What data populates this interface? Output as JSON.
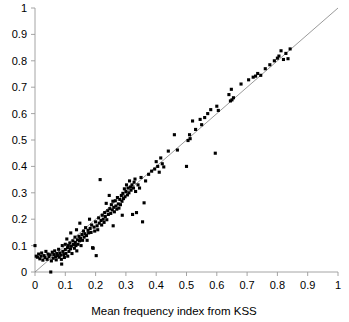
{
  "chart_data": {
    "type": "scatter",
    "title": "",
    "xlabel": "Mean frequency index from KSS",
    "ylabel": "",
    "xlim": [
      0,
      1
    ],
    "ylim": [
      0,
      1
    ],
    "grid": false,
    "legend": null,
    "xticks": [
      "0",
      "0.1",
      "0.2",
      "0.3",
      "0.4",
      "0.5",
      "0.6",
      "0.7",
      "0.8",
      "0.9",
      "1"
    ],
    "yticks": [
      "0",
      "0.1",
      "0.2",
      "0.3",
      "0.4",
      "0.5",
      "0.6",
      "0.7",
      "0.8",
      "0.9",
      "1"
    ],
    "xtick_values": [
      0,
      0.1,
      0.2,
      0.3,
      0.4,
      0.5,
      0.6,
      0.7,
      0.8,
      0.9,
      1
    ],
    "ytick_values": [
      0,
      0.1,
      0.2,
      0.3,
      0.4,
      0.5,
      0.6,
      0.7,
      0.8,
      0.9,
      1
    ],
    "marker": {
      "shape": "square",
      "size": 3.1,
      "color": "#000000"
    },
    "reference_line": {
      "name": "identity-line",
      "from": [
        0,
        0
      ],
      "to": [
        1,
        1
      ],
      "color": "#808080",
      "width": 0.8,
      "style": "solid"
    },
    "series": [
      {
        "name": "samples",
        "color": "#000000",
        "points": [
          [
            0.0,
            0.1
          ],
          [
            0.004,
            0.06
          ],
          [
            0.008,
            0.056
          ],
          [
            0.012,
            0.068
          ],
          [
            0.016,
            0.05
          ],
          [
            0.02,
            0.06
          ],
          [
            0.022,
            0.072
          ],
          [
            0.026,
            0.045
          ],
          [
            0.03,
            0.062
          ],
          [
            0.033,
            0.055
          ],
          [
            0.036,
            0.078
          ],
          [
            0.04,
            0.048
          ],
          [
            0.043,
            0.068
          ],
          [
            0.046,
            0.058
          ],
          [
            0.05,
            0.065
          ],
          [
            0.052,
            0.0
          ],
          [
            0.054,
            0.042
          ],
          [
            0.057,
            0.075
          ],
          [
            0.06,
            0.052
          ],
          [
            0.062,
            0.066
          ],
          [
            0.065,
            0.08
          ],
          [
            0.068,
            0.058
          ],
          [
            0.07,
            0.046
          ],
          [
            0.072,
            0.07
          ],
          [
            0.075,
            0.062
          ],
          [
            0.078,
            0.086
          ],
          [
            0.08,
            0.056
          ],
          [
            0.082,
            0.072
          ],
          [
            0.085,
            0.064
          ],
          [
            0.087,
            0.048
          ],
          [
            0.088,
            0.03
          ],
          [
            0.09,
            0.1
          ],
          [
            0.092,
            0.078
          ],
          [
            0.095,
            0.066
          ],
          [
            0.097,
            0.055
          ],
          [
            0.1,
            0.085
          ],
          [
            0.1,
            0.105
          ],
          [
            0.102,
            0.07
          ],
          [
            0.105,
            0.125
          ],
          [
            0.107,
            0.092
          ],
          [
            0.108,
            0.06
          ],
          [
            0.11,
            0.1
          ],
          [
            0.112,
            0.078
          ],
          [
            0.115,
            0.11
          ],
          [
            0.117,
            0.088
          ],
          [
            0.118,
            0.148
          ],
          [
            0.12,
            0.098
          ],
          [
            0.122,
            0.07
          ],
          [
            0.125,
            0.118
          ],
          [
            0.127,
            0.104
          ],
          [
            0.13,
            0.09
          ],
          [
            0.132,
            0.132
          ],
          [
            0.133,
            0.112
          ],
          [
            0.135,
            0.1
          ],
          [
            0.137,
            0.16
          ],
          [
            0.138,
            0.08
          ],
          [
            0.14,
            0.122
          ],
          [
            0.142,
            0.105
          ],
          [
            0.145,
            0.135
          ],
          [
            0.147,
            0.118
          ],
          [
            0.148,
            0.185
          ],
          [
            0.15,
            0.128
          ],
          [
            0.152,
            0.1
          ],
          [
            0.155,
            0.142
          ],
          [
            0.157,
            0.12
          ],
          [
            0.16,
            0.155
          ],
          [
            0.162,
            0.132
          ],
          [
            0.165,
            0.145
          ],
          [
            0.167,
            0.168
          ],
          [
            0.17,
            0.138
          ],
          [
            0.172,
            0.12
          ],
          [
            0.175,
            0.158
          ],
          [
            0.177,
            0.148
          ],
          [
            0.18,
            0.2
          ],
          [
            0.182,
            0.165
          ],
          [
            0.185,
            0.15
          ],
          [
            0.187,
            0.178
          ],
          [
            0.19,
            0.092
          ],
          [
            0.192,
            0.09
          ],
          [
            0.195,
            0.17
          ],
          [
            0.197,
            0.155
          ],
          [
            0.2,
            0.19
          ],
          [
            0.202,
            0.062
          ],
          [
            0.205,
            0.175
          ],
          [
            0.207,
            0.16
          ],
          [
            0.21,
            0.205
          ],
          [
            0.212,
            0.185
          ],
          [
            0.215,
            0.35
          ],
          [
            0.218,
            0.195
          ],
          [
            0.22,
            0.178
          ],
          [
            0.222,
            0.215
          ],
          [
            0.225,
            0.2
          ],
          [
            0.228,
            0.188
          ],
          [
            0.23,
            0.225
          ],
          [
            0.232,
            0.21
          ],
          [
            0.235,
            0.26
          ],
          [
            0.237,
            0.198
          ],
          [
            0.24,
            0.232
          ],
          [
            0.242,
            0.218
          ],
          [
            0.245,
            0.29
          ],
          [
            0.247,
            0.24
          ],
          [
            0.25,
            0.222
          ],
          [
            0.252,
            0.255
          ],
          [
            0.255,
            0.235
          ],
          [
            0.257,
            0.268
          ],
          [
            0.258,
            0.175
          ],
          [
            0.26,
            0.245
          ],
          [
            0.262,
            0.228
          ],
          [
            0.265,
            0.27
          ],
          [
            0.267,
            0.25
          ],
          [
            0.27,
            0.238
          ],
          [
            0.272,
            0.282
          ],
          [
            0.275,
            0.258
          ],
          [
            0.277,
            0.242
          ],
          [
            0.28,
            0.275
          ],
          [
            0.282,
            0.255
          ],
          [
            0.285,
            0.29
          ],
          [
            0.287,
            0.268
          ],
          [
            0.288,
            0.215
          ],
          [
            0.29,
            0.298
          ],
          [
            0.292,
            0.278
          ],
          [
            0.295,
            0.315
          ],
          [
            0.297,
            0.285
          ],
          [
            0.3,
            0.305
          ],
          [
            0.302,
            0.33
          ],
          [
            0.305,
            0.292
          ],
          [
            0.307,
            0.318
          ],
          [
            0.31,
            0.3
          ],
          [
            0.312,
            0.345
          ],
          [
            0.315,
            0.322
          ],
          [
            0.317,
            0.31
          ],
          [
            0.32,
            0.33
          ],
          [
            0.322,
            0.218
          ],
          [
            0.325,
            0.318
          ],
          [
            0.327,
            0.34
          ],
          [
            0.33,
            0.352
          ],
          [
            0.332,
            0.305
          ],
          [
            0.335,
            0.225
          ],
          [
            0.34,
            0.33
          ],
          [
            0.345,
            0.318
          ],
          [
            0.35,
            0.358
          ],
          [
            0.355,
            0.19
          ],
          [
            0.36,
            0.262
          ],
          [
            0.365,
            0.345
          ],
          [
            0.375,
            0.37
          ],
          [
            0.385,
            0.382
          ],
          [
            0.395,
            0.39
          ],
          [
            0.4,
            0.418
          ],
          [
            0.405,
            0.4
          ],
          [
            0.41,
            0.378
          ],
          [
            0.415,
            0.432
          ],
          [
            0.42,
            0.41
          ],
          [
            0.425,
            0.398
          ],
          [
            0.44,
            0.458
          ],
          [
            0.46,
            0.52
          ],
          [
            0.47,
            0.462
          ],
          [
            0.5,
            0.4
          ],
          [
            0.505,
            0.498
          ],
          [
            0.51,
            0.52
          ],
          [
            0.512,
            0.505
          ],
          [
            0.52,
            0.572
          ],
          [
            0.53,
            0.54
          ],
          [
            0.545,
            0.578
          ],
          [
            0.55,
            0.558
          ],
          [
            0.56,
            0.585
          ],
          [
            0.57,
            0.6
          ],
          [
            0.58,
            0.615
          ],
          [
            0.595,
            0.45
          ],
          [
            0.6,
            0.628
          ],
          [
            0.605,
            0.612
          ],
          [
            0.64,
            0.672
          ],
          [
            0.645,
            0.648
          ],
          [
            0.648,
            0.692
          ],
          [
            0.65,
            0.652
          ],
          [
            0.655,
            0.66
          ],
          [
            0.68,
            0.712
          ],
          [
            0.705,
            0.728
          ],
          [
            0.72,
            0.738
          ],
          [
            0.728,
            0.742
          ],
          [
            0.735,
            0.752
          ],
          [
            0.745,
            0.745
          ],
          [
            0.76,
            0.77
          ],
          [
            0.775,
            0.785
          ],
          [
            0.79,
            0.8
          ],
          [
            0.8,
            0.81
          ],
          [
            0.805,
            0.818
          ],
          [
            0.812,
            0.838
          ],
          [
            0.82,
            0.805
          ],
          [
            0.828,
            0.828
          ],
          [
            0.835,
            0.808
          ],
          [
            0.842,
            0.845
          ]
        ]
      }
    ]
  }
}
